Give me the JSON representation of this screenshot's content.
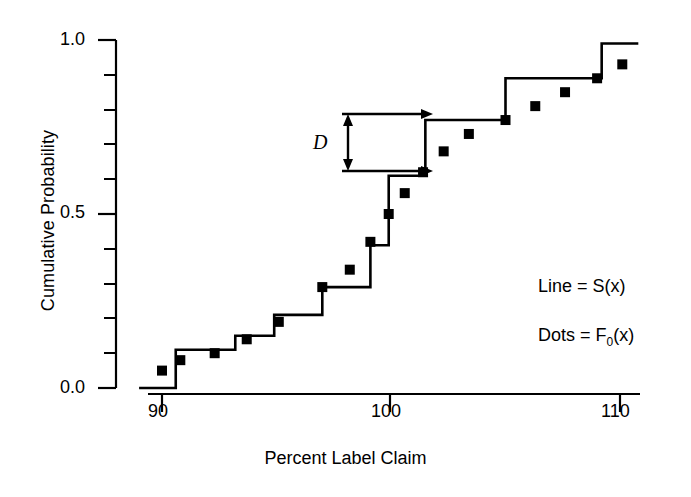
{
  "chart_data": {
    "type": "line",
    "title": "",
    "xlabel": "Percent Label Claim",
    "ylabel": "Cumulative Probability",
    "xlim": [
      89,
      111
    ],
    "ylim": [
      0.0,
      1.0
    ],
    "xticks": [
      90,
      100,
      110
    ],
    "xtick_labels": [
      "90",
      "100",
      "110"
    ],
    "yticks": [
      0.0,
      0.5,
      1.0
    ],
    "ytick_labels": [
      "0.0",
      "0.5",
      "1.0"
    ],
    "yminor_ticks": [
      0.05,
      0.1,
      0.15,
      0.2,
      0.25,
      0.3,
      0.35,
      0.4,
      0.45,
      0.55,
      0.6,
      0.65,
      0.7,
      0.75,
      0.8,
      0.85,
      0.9,
      0.95
    ],
    "grid": false,
    "legend_position": "lower-right",
    "series": [
      {
        "name": "Line = S(x)",
        "type": "step",
        "style": "step-post",
        "color": "#000000",
        "x": [
          89.0,
          90.6,
          93.2,
          94.9,
          97.0,
          99.1,
          99.9,
          101.5,
          105.0,
          109.2,
          110.6
        ],
        "y": [
          0.0,
          0.11,
          0.15,
          0.21,
          0.29,
          0.41,
          0.61,
          0.77,
          0.89,
          0.99,
          0.99
        ]
      },
      {
        "name": "Dots = F0(x)",
        "type": "scatter",
        "marker": "square",
        "color": "#000000",
        "points": [
          {
            "x": 90.0,
            "y": 0.05
          },
          {
            "x": 90.8,
            "y": 0.08
          },
          {
            "x": 92.3,
            "y": 0.1
          },
          {
            "x": 93.7,
            "y": 0.14
          },
          {
            "x": 95.1,
            "y": 0.19
          },
          {
            "x": 97.0,
            "y": 0.29
          },
          {
            "x": 98.2,
            "y": 0.34
          },
          {
            "x": 99.1,
            "y": 0.42
          },
          {
            "x": 99.9,
            "y": 0.5
          },
          {
            "x": 100.6,
            "y": 0.56
          },
          {
            "x": 101.4,
            "y": 0.62
          },
          {
            "x": 102.3,
            "y": 0.68
          },
          {
            "x": 103.4,
            "y": 0.73
          },
          {
            "x": 105.0,
            "y": 0.77
          },
          {
            "x": 106.3,
            "y": 0.81
          },
          {
            "x": 107.6,
            "y": 0.85
          },
          {
            "x": 109.0,
            "y": 0.89
          },
          {
            "x": 110.1,
            "y": 0.93
          }
        ]
      }
    ],
    "annotations": [
      {
        "name": "D",
        "label": "D",
        "type": "double-arrow-vertical",
        "upper_y": 0.77,
        "lower_y": 0.61,
        "x": 99.9,
        "description": "Maximum vertical distance D between S(x) and F0(x)"
      }
    ]
  },
  "axes": {
    "ylabel": "Cumulative Probability",
    "xlabel": "Percent Label Claim",
    "ytick_labels": [
      "1.0",
      "0.5",
      "0.0"
    ],
    "xtick_labels": [
      "90",
      "100",
      "110"
    ]
  },
  "legend": {
    "line_entry_prefix": "Line = S(",
    "line_entry_suffix": "x)",
    "line_entry": "Line = S(x)",
    "dots_entry_prefix": "Dots = F",
    "dots_entry_sub": "0",
    "dots_entry_suffix": "(x)",
    "dots_entry": "Dots = F0(x)"
  },
  "annotation": {
    "d_label": "D"
  },
  "colors": {
    "foreground": "#000000",
    "background": "#ffffff"
  }
}
